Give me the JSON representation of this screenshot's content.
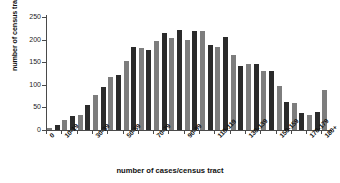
{
  "chart_data": {
    "type": "bar",
    "title": "",
    "xlabel": "number of cases/census tract",
    "ylabel": "number of census tracts",
    "ylim": [
      0,
      250
    ],
    "yticks": [
      0,
      50,
      100,
      150,
      200,
      250
    ],
    "grid": false,
    "legend": null,
    "categories": [
      "0-4",
      "5-9",
      "10-14",
      "15-19",
      "20-24",
      "25-29",
      "30-34",
      "35-39",
      "40-44",
      "45-49",
      "50-54",
      "55-59",
      "60-64",
      "65-69",
      "70-74",
      "75-79",
      "80-84",
      "85-89",
      "90-94",
      "95-99",
      "100-104",
      "105-109",
      "110-114",
      "115-119",
      "120-124",
      "125-129",
      "130-134",
      "135-139",
      "140-144",
      "145-149",
      "150-154",
      "155-159",
      "160-164",
      "165-169",
      "170-174",
      "175-179",
      "180+"
    ],
    "values": [
      4,
      10,
      22,
      30,
      33,
      55,
      78,
      96,
      118,
      122,
      152,
      183,
      181,
      178,
      196,
      214,
      203,
      221,
      199,
      220,
      218,
      187,
      184,
      205,
      166,
      141,
      145,
      146,
      131,
      130,
      98,
      62,
      60,
      37,
      33,
      40,
      88
    ],
    "bar_colors": [
      "#7d7d7d",
      "#2b2b2b"
    ],
    "visible_xtick_labels": [
      {
        "index": 0,
        "label": "0"
      },
      {
        "index": 2,
        "label": "10-19"
      },
      {
        "index": 6,
        "label": "30-39"
      },
      {
        "index": 10,
        "label": "50-59"
      },
      {
        "index": 14,
        "label": "70-79"
      },
      {
        "index": 18,
        "label": "90-99"
      },
      {
        "index": 22,
        "label": "110-119"
      },
      {
        "index": 26,
        "label": "130-139"
      },
      {
        "index": 30,
        "label": "150-159"
      },
      {
        "index": 34,
        "label": "170-179"
      },
      {
        "index": 36,
        "label": "180+"
      }
    ]
  }
}
